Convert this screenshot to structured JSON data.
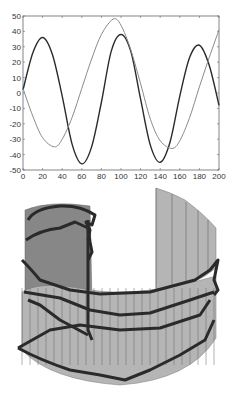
{
  "chart_data": [
    {
      "type": "line",
      "title": "",
      "xlabel": "",
      "ylabel": "",
      "xlim": [
        0,
        200
      ],
      "ylim": [
        -50,
        50
      ],
      "grid": false,
      "legend": null,
      "x_ticks": [
        "0",
        "20",
        "40",
        "60",
        "80",
        "100",
        "120",
        "140",
        "160",
        "180",
        "200"
      ],
      "y_ticks": [
        "50",
        "40",
        "30",
        "20",
        "10",
        "0",
        "-10",
        "-20",
        "-30",
        "-40",
        "-50"
      ],
      "series": [
        {
          "name": "dark-curve",
          "color": "#2a2a2a",
          "x": [
            0,
            10,
            20,
            30,
            40,
            50,
            60,
            70,
            80,
            90,
            100,
            110,
            120,
            130,
            140,
            150,
            160,
            170,
            180,
            190,
            200
          ],
          "y": [
            2,
            26,
            36,
            25,
            -2,
            -33,
            -46,
            -35,
            -6,
            27,
            38,
            27,
            -4,
            -34,
            -45,
            -32,
            -2,
            23,
            31,
            18,
            -8
          ]
        },
        {
          "name": "light-curve",
          "color": "#8a8a8a",
          "x": [
            0,
            10,
            20,
            32,
            40,
            50,
            60,
            70,
            80,
            92,
            100,
            110,
            120,
            130,
            140,
            152,
            160,
            170,
            180,
            190,
            200
          ],
          "y": [
            3,
            -15,
            -29,
            -35,
            -30,
            -16,
            3,
            22,
            38,
            48,
            44,
            28,
            6,
            -17,
            -31,
            -36,
            -31,
            -16,
            4,
            23,
            41
          ]
        }
      ]
    },
    {
      "type": "surface",
      "title": "",
      "description": "3D partial cylindrical mesh surface with multiple thick dark trajectory loops wrapped around it",
      "surface_color": "#9a9a9a",
      "trajectory_color": "#2a2a2a"
    }
  ]
}
